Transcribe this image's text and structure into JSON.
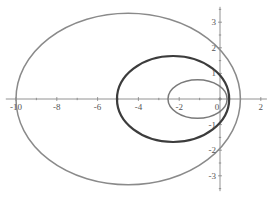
{
  "chart_data": {
    "type": "line",
    "title": "",
    "xlabel": "",
    "ylabel": "",
    "xlim": [
      -10.5,
      2.3
    ],
    "ylim": [
      -3.6,
      3.6
    ],
    "grid": false,
    "legend": null,
    "x_ticks": [
      -10,
      -8,
      -6,
      -4,
      -2,
      0,
      2
    ],
    "x_tick_labels": [
      "-10",
      "-8",
      "-6",
      "-4",
      "-2",
      "0",
      "2"
    ],
    "y_ticks": [
      3,
      2,
      1,
      -1,
      -2,
      -3
    ],
    "y_tick_labels": [
      "3",
      "2",
      "1",
      "-1",
      "-2",
      "-3"
    ],
    "series": [
      {
        "name": "outer-ellipse",
        "shape": "ellipse",
        "cx": -4.5,
        "cy": 0,
        "rx": 5.5,
        "ry": 3.35,
        "x_range": [
          -10,
          1
        ],
        "y_range": [
          -3.35,
          3.35
        ],
        "color": "#8a8a8a",
        "stroke_width": 1.5
      },
      {
        "name": "middle-ellipse",
        "shape": "ellipse",
        "cx": -2.3,
        "cy": 0,
        "rx": 2.75,
        "ry": 1.68,
        "x_range": [
          -5.05,
          0.45
        ],
        "y_range": [
          -1.68,
          1.68
        ],
        "color": "#3c3c3c",
        "stroke_width": 2.2
      },
      {
        "name": "inner-ellipse",
        "shape": "ellipse",
        "cx": -1.1,
        "cy": 0,
        "rx": 1.45,
        "ry": 0.75,
        "x_range": [
          -2.55,
          0.35
        ],
        "y_range": [
          -0.75,
          0.75
        ],
        "color": "#7a7a7a",
        "stroke_width": 1.5
      }
    ]
  },
  "plot": {
    "x_origin_px": 220,
    "y_origin_px": 99,
    "x_scale_px": 20.4,
    "y_scale_px": 25.6,
    "axis_color": "#777777"
  }
}
